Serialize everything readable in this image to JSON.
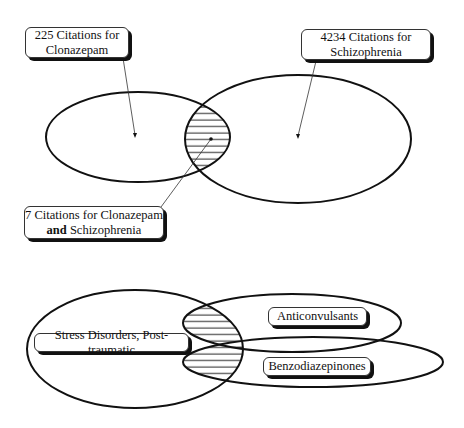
{
  "top_venn": {
    "sets": [
      {
        "id": "clonazepam",
        "label_line1": "225 Citations for",
        "label_line2": "Clonazepam",
        "count": 225
      },
      {
        "id": "schizophrenia",
        "label_line1": "4234 Citations for",
        "label_line2": "Schizophrenia",
        "count": 4234
      }
    ],
    "intersection": {
      "label_line1": "7 Citations for Clonazepam",
      "label_bold": "and",
      "label_line2_rest": " Schizophrenia",
      "count": 7
    }
  },
  "bottom_venn": {
    "sets": [
      {
        "id": "stress",
        "label": "Stress Disorders, Post-traumatic"
      },
      {
        "id": "anticonvulsants",
        "label": "Anticonvulsants"
      },
      {
        "id": "benzodiazepinones",
        "label": "Benzodiazepinones"
      }
    ]
  },
  "colors": {
    "stroke": "#111111",
    "background": "#ffffff"
  }
}
